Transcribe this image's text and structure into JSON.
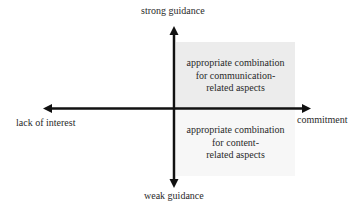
{
  "diagram": {
    "type": "quadrant",
    "axes": {
      "vertical": {
        "top_label": "strong guidance",
        "bottom_label": "weak guidance"
      },
      "horizontal": {
        "left_label": "lack of interest",
        "right_label": "commitment"
      }
    },
    "quadrants": {
      "top_right": {
        "lines": [
          "appropriate combination",
          "for communication-",
          "related aspects"
        ],
        "fill": "#ececec"
      },
      "bottom_right": {
        "lines": [
          "appropriate combination",
          "for content-",
          "related aspects"
        ],
        "fill": "#f7f7f7"
      }
    },
    "colors": {
      "axis": "#111111",
      "text": "#2a2a2a"
    }
  }
}
